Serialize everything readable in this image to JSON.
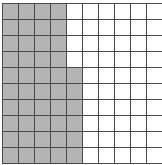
{
  "figure": {
    "type": "grid-shading-diagram",
    "columns": 10,
    "rows": 10,
    "cell_width_px": 15,
    "cell_height_px": 15,
    "grid_line_color": "#4a4a4a",
    "grid_line_width_px": 1,
    "shaded_color": "#b4b4b4",
    "unshaded_color": "#ffffff",
    "total_cells": 100,
    "shaded_cells_count": 46,
    "unshaded_cells_count": 54,
    "shaded_fraction": "46/100",
    "shaded_per_row": [
      4,
      4,
      4,
      4,
      5,
      5,
      5,
      5,
      5,
      5
    ],
    "rows_data": [
      [
        1,
        1,
        1,
        1,
        0,
        0,
        0,
        0,
        0,
        0
      ],
      [
        1,
        1,
        1,
        1,
        0,
        0,
        0,
        0,
        0,
        0
      ],
      [
        1,
        1,
        1,
        1,
        0,
        0,
        0,
        0,
        0,
        0
      ],
      [
        1,
        1,
        1,
        1,
        0,
        0,
        0,
        0,
        0,
        0
      ],
      [
        1,
        1,
        1,
        1,
        1,
        0,
        0,
        0,
        0,
        0
      ],
      [
        1,
        1,
        1,
        1,
        1,
        0,
        0,
        0,
        0,
        0
      ],
      [
        1,
        1,
        1,
        1,
        1,
        0,
        0,
        0,
        0,
        0
      ],
      [
        1,
        1,
        1,
        1,
        1,
        0,
        0,
        0,
        0,
        0
      ],
      [
        1,
        1,
        1,
        1,
        1,
        0,
        0,
        0,
        0,
        0
      ],
      [
        1,
        1,
        1,
        1,
        1,
        0,
        0,
        0,
        0,
        0
      ]
    ]
  }
}
